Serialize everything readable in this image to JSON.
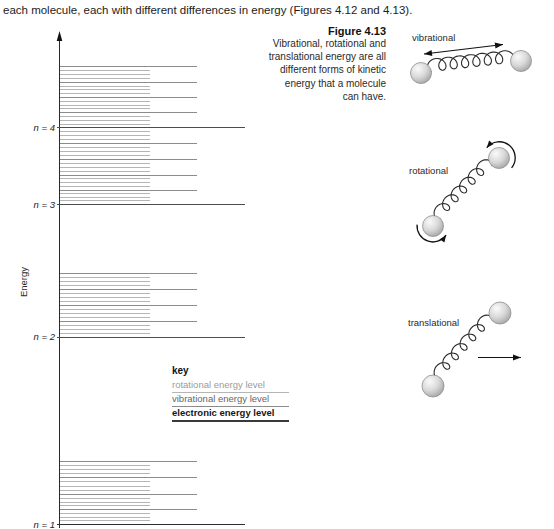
{
  "intro": {
    "text": "each molecule, each with different differences in energy (Figures 4.12 and 4.13)."
  },
  "figure": {
    "label": "Figure 4.13",
    "caption_lines": [
      "Vibrational, rotational and",
      "translational energy are all",
      "different forms of kinetic",
      "energy that a molecule",
      "can have."
    ]
  },
  "key": {
    "title": "key",
    "items": [
      {
        "label": "rotational energy level",
        "type": "rotational"
      },
      {
        "label": "vibrational energy level",
        "type": "vibrational"
      },
      {
        "label": "electronic energy level",
        "type": "electronic"
      }
    ]
  },
  "molecule_labels": {
    "vibrational": "vibrational",
    "rotational": "rotational",
    "translational": "translational"
  },
  "diagram": {
    "axis_label": "Energy",
    "axis": {
      "x": 59.5,
      "top": 31,
      "bottom": 528
    },
    "x_extents": {
      "rot": [
        60,
        150
      ],
      "vib": [
        60,
        197
      ],
      "elec": [
        56.5,
        245
      ]
    },
    "rot_per_gap": 3,
    "bands": [
      {
        "label": "n = 4",
        "electronic_y": 127.8,
        "vibrational_y": [
          66.7,
          82.3,
          97.3,
          112.7
        ],
        "rot_above_y": null
      },
      {
        "label": "n = 3",
        "electronic_y": 204.5,
        "vibrational_y": [
          143.3,
          159.3,
          175.0,
          190.3
        ],
        "rot_above_y": 127.8
      },
      {
        "label": "n = 2",
        "electronic_y": 337.3,
        "vibrational_y": [
          273.0,
          289.3,
          305.3,
          321.3
        ],
        "rot_above_y": null
      },
      {
        "label": "n = 1",
        "electronic_y": 524.5,
        "vibrational_y": [
          461.0,
          477.7,
          494.3,
          509.7
        ],
        "rot_above_y": null
      }
    ],
    "molecules": {
      "vibrational": {
        "balls": [
          [
            421,
            73
          ],
          [
            521,
            61
          ]
        ],
        "ball_r": 10.5,
        "spring": [
          [
            431.5,
            71.5
          ],
          [
            511,
            62.5
          ]
        ],
        "loops": 7,
        "loop_r": 6.2,
        "double_arrow": [
          [
            424,
            54
          ],
          [
            503,
            44.5
          ]
        ]
      },
      "rotational": {
        "balls": [
          [
            433,
            226
          ],
          [
            499,
            158
          ]
        ],
        "ball_r": 10.5,
        "spring": [
          [
            440.5,
            218.5
          ],
          [
            491.5,
            166
          ]
        ],
        "loops": 6,
        "loop_r": 5.5,
        "arcs": [
          {
            "c": [
              499,
              158
            ],
            "r": 16,
            "a0": 38,
            "a1": -140
          },
          {
            "c": [
              433,
              226
            ],
            "r": 16,
            "a0": 185,
            "a1": 35
          }
        ]
      },
      "translational": {
        "balls": [
          [
            433,
            386
          ],
          [
            500,
            313
          ]
        ],
        "ball_r": 11,
        "spring": [
          [
            440.5,
            378
          ],
          [
            492.5,
            321
          ]
        ],
        "loops": 6,
        "loop_r": 5.5,
        "arrow": [
          [
            478,
            357.5
          ],
          [
            521,
            357.5
          ]
        ]
      }
    },
    "colors": {
      "rotational_line": "#b5b5b5",
      "vibrational_line": "#8c8c8c",
      "electronic_line": "#4d4d4d",
      "ground_line": "#2e2e2e",
      "axis": "#2a2a2a",
      "spring": "#2b2b2b",
      "arrow": "#111111",
      "ball_edge": "#8f8f8f"
    }
  }
}
